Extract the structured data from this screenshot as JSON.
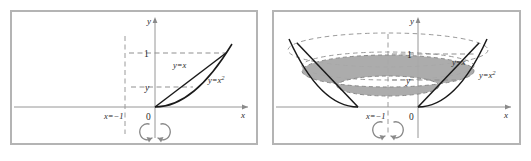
{
  "figure": {
    "panels": [
      {
        "id": "region-panel",
        "name": "Plane region bounded by y = x and y = x^2",
        "axes": {
          "x_axis_label": "x",
          "y_axis_label": "y",
          "origin_label": "0"
        },
        "ticks": {
          "y_one": "1",
          "y_generic": "y"
        },
        "curves": [
          {
            "label": "y=x",
            "label_text": "y=x",
            "equation": "y = x",
            "style": "solid",
            "color": "#1a1a1a"
          },
          {
            "label": "y=x2",
            "label_text": "y=x",
            "exponent": "2",
            "equation": "y = x²",
            "style": "solid",
            "color": "#1a1a1a"
          }
        ],
        "axis_of_rotation": {
          "label_text": "x=−1",
          "equation": "x = -1",
          "style": "dashed",
          "color": "#9a9a9a"
        },
        "rotation_symbol": "double-curved-arrow",
        "guide_lines": [
          {
            "from_tick": "1",
            "style": "dashed",
            "color": "#8f8f8f"
          },
          {
            "from_tick": "y",
            "style": "dashed",
            "color": "#8f8f8f"
          }
        ]
      },
      {
        "id": "solid-panel",
        "name": "Solid of revolution with washer cross-section",
        "axes": {
          "x_axis_label": "x",
          "y_axis_label": "y",
          "origin_label": "0"
        },
        "ticks": {
          "y_one": "1",
          "y_generic": "y"
        },
        "curves": [
          {
            "label": "y=x",
            "label_text": "y=x",
            "equation": "y = x",
            "style": "solid",
            "color": "#1a1a1a"
          },
          {
            "label": "y=x2",
            "label_text": "y=x",
            "exponent": "2",
            "equation": "y = x²",
            "style": "solid",
            "color": "#1a1a1a"
          }
        ],
        "axis_of_rotation": {
          "label_text": "x=−1",
          "equation": "x = -1",
          "style": "dashed",
          "color": "#9a9a9a"
        },
        "rotation_symbol": "double-curved-arrow",
        "washer": {
          "description": "shaded annular cross-section at height y",
          "fill": "#a8a8a8",
          "stroke": "#8a8a8a"
        },
        "top_rim": {
          "description": "dashed ellipse rim at y = 1",
          "style": "dashed",
          "color": "#9a9a9a"
        }
      }
    ],
    "colors": {
      "panel_border": "#b4b4b4",
      "axis": "#8a8a8a",
      "curve": "#1a1a1a",
      "dashed_guide": "#8f8f8f",
      "washer_fill": "#a8a8a8",
      "text": "#2b2b2b"
    }
  }
}
